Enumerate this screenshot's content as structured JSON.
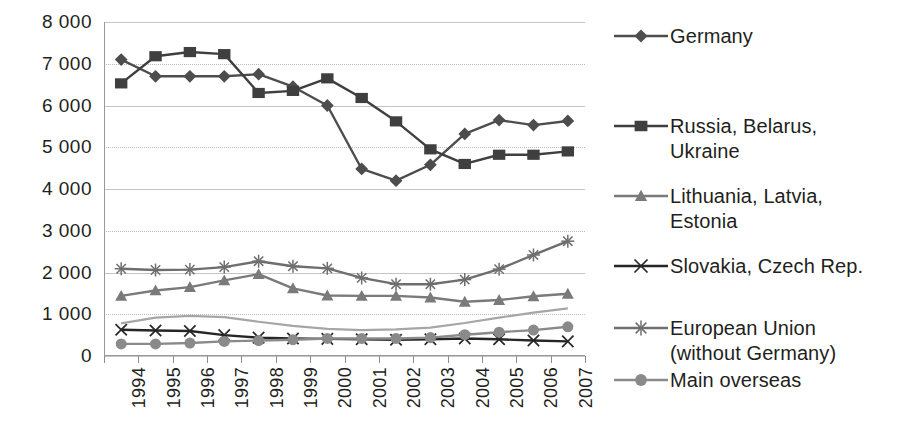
{
  "chart_data": {
    "type": "line",
    "title": "",
    "subtitle": "",
    "xlabel": "",
    "ylabel": "",
    "categories": [
      "1994",
      "1995",
      "1996",
      "1997",
      "1998",
      "1999",
      "2000",
      "2001",
      "2002",
      "2003",
      "2004",
      "2005",
      "2006",
      "2007"
    ],
    "ylim": [
      0,
      8000
    ],
    "ytick_values": [
      0,
      1000,
      2000,
      3000,
      4000,
      5000,
      6000,
      7000,
      8000
    ],
    "ytick_labels": [
      "0",
      "1 000",
      "2 000",
      "3 000",
      "4 000",
      "5 000",
      "6 000",
      "7 000",
      "8 000"
    ],
    "grid": true,
    "grid_axis": "y",
    "legend_position": "right",
    "series": [
      {
        "name": "Germany",
        "marker": "diamond",
        "color": "#4d4d4d",
        "values": [
          7100,
          6700,
          6700,
          6700,
          6750,
          6450,
          6000,
          4480,
          4200,
          4580,
          5320,
          5650,
          5530,
          5630
        ]
      },
      {
        "name": "Russia, Belarus, Ukraine",
        "marker": "square",
        "color": "#3f3f3f",
        "values": [
          6530,
          7180,
          7280,
          7230,
          6300,
          6350,
          6650,
          6180,
          5620,
          4950,
          4600,
          4820,
          4820,
          4900
        ]
      },
      {
        "name": "Lithuania, Latvia, Estonia",
        "marker": "triangle",
        "color": "#7a7a7a",
        "values": [
          1440,
          1570,
          1650,
          1810,
          1960,
          1620,
          1450,
          1440,
          1440,
          1400,
          1300,
          1340,
          1430,
          1490
        ]
      },
      {
        "name": "Slovakia, Czech Rep.",
        "marker": "cross",
        "color": "#262626",
        "values": [
          630,
          610,
          600,
          500,
          440,
          420,
          410,
          400,
          390,
          400,
          420,
          400,
          370,
          350
        ]
      },
      {
        "name": "European Union (without Germany)",
        "marker": "asterisk",
        "color": "#6e6e6e",
        "values": [
          2090,
          2060,
          2070,
          2130,
          2270,
          2150,
          2100,
          1870,
          1720,
          1720,
          1830,
          2080,
          2420,
          2750
        ]
      },
      {
        "name": "Main overseas",
        "marker": "circle",
        "color": "#8a8a8a",
        "values": [
          290,
          290,
          310,
          350,
          370,
          390,
          420,
          420,
          420,
          440,
          510,
          570,
          620,
          700
        ]
      },
      {
        "name": "",
        "marker": "none",
        "color": "#a6a6a6",
        "values": [
          780,
          920,
          960,
          930,
          820,
          720,
          650,
          620,
          640,
          680,
          790,
          920,
          1040,
          1140
        ]
      }
    ]
  },
  "legend": {
    "items": [
      {
        "label": "Germany",
        "marker": "diamond",
        "color": "#4d4d4d"
      },
      {
        "label": "Russia, Belarus,\nUkraine",
        "marker": "square",
        "color": "#3f3f3f"
      },
      {
        "label": "Lithuania, Latvia,\nEstonia",
        "marker": "triangle",
        "color": "#7a7a7a"
      },
      {
        "label": "Slovakia, Czech Rep.",
        "marker": "cross",
        "color": "#262626"
      },
      {
        "label": "European Union\n(without Germany)",
        "marker": "asterisk",
        "color": "#6e6e6e"
      },
      {
        "label": "Main overseas",
        "marker": "circle",
        "color": "#8a8a8a"
      }
    ]
  }
}
